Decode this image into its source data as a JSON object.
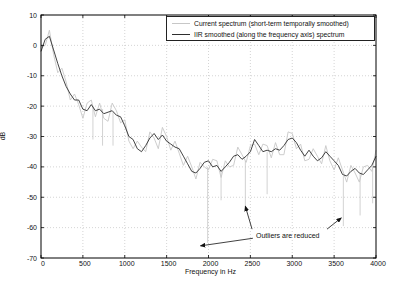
{
  "figure": {
    "background_color": "#ffffff",
    "axis_color": "#000000",
    "grid_color": "#b8b8b8"
  },
  "chart_data": {
    "type": "line",
    "title": "",
    "xlabel": "Frequency in Hz",
    "ylabel": "dB",
    "xlim": [
      0,
      4000
    ],
    "ylim": [
      -70,
      10
    ],
    "xticks": [
      0,
      500,
      1000,
      1500,
      2000,
      2500,
      3000,
      3500,
      4000
    ],
    "yticks": [
      10,
      0,
      -10,
      -20,
      -30,
      -40,
      -50,
      -60,
      -70
    ],
    "grid": "dotted",
    "legend_position": "top-right",
    "x_start": 0,
    "x_step": 50,
    "series": [
      {
        "name": "Current spectrum (short-term temporally smoothed)",
        "color": "#c7c7c7",
        "values": [
          -0.5,
          0,
          5,
          -3,
          -9,
          -7.5,
          -12,
          -18,
          -16,
          -19.5,
          -24,
          -19,
          -18,
          -23.5,
          -19,
          -24,
          -25,
          -19,
          -21.5,
          -25.5,
          -24.5,
          -31.5,
          -34,
          -31.5,
          -33.5,
          -35,
          -28.5,
          -30.5,
          -34,
          -27,
          -30,
          -34.5,
          -31.5,
          -35.5,
          -39.5,
          -36.5,
          -40,
          -44,
          -38.5,
          -40,
          -41,
          -37.5,
          -38,
          -43.5,
          -38,
          -40,
          -39.5,
          -33.5,
          -36,
          -38.5,
          -33,
          -32.5,
          -36,
          -32.5,
          -33,
          -37,
          -32,
          -36,
          -36,
          -28.5,
          -29,
          -34,
          -32.5,
          -38,
          -37.5,
          -34,
          -36.5,
          -39,
          -33,
          -38,
          -41,
          -37,
          -41,
          -45,
          -39.5,
          -42,
          -45,
          -40,
          -39.5,
          -41.5,
          -34.5
        ]
      },
      {
        "name": "IIR smoothed (along the frequency axis) spectrum",
        "color": "#2e2e2e",
        "values": [
          -2,
          2,
          3,
          -1.5,
          -6,
          -10,
          -13.5,
          -16,
          -18,
          -18,
          -21,
          -21.5,
          -19.5,
          -21.5,
          -21,
          -22.5,
          -22,
          -21.5,
          -23,
          -23.5,
          -26.5,
          -30,
          -31,
          -34,
          -35,
          -33,
          -30.5,
          -29,
          -31,
          -29.5,
          -31.5,
          -32.5,
          -33.5,
          -34,
          -36.5,
          -39,
          -41.5,
          -42,
          -40.5,
          -38.5,
          -38,
          -40,
          -39.5,
          -41.5,
          -40,
          -38.5,
          -36.5,
          -36,
          -37.5,
          -36.5,
          -35,
          -31,
          -33,
          -35,
          -34.5,
          -35,
          -34,
          -34.5,
          -33,
          -31,
          -30.5,
          -32,
          -34.5,
          -36.5,
          -34.5,
          -36.5,
          -38,
          -37,
          -35,
          -36.5,
          -38,
          -39.5,
          -42.5,
          -43,
          -41.5,
          -40.5,
          -42,
          -42.5,
          -41,
          -39.5,
          -36.5
        ]
      }
    ],
    "outlier_spikes": [
      {
        "f": 620,
        "from": -20,
        "to": -31
      },
      {
        "f": 735,
        "from": -21,
        "to": -33
      },
      {
        "f": 860,
        "from": -22,
        "to": -33
      },
      {
        "f": 1990,
        "from": -40,
        "to": -65
      },
      {
        "f": 2150,
        "from": -41,
        "to": -51
      },
      {
        "f": 2440,
        "from": -38,
        "to": -54.5
      },
      {
        "f": 2700,
        "from": -35,
        "to": -49
      },
      {
        "f": 3610,
        "from": -43,
        "to": -59.5
      },
      {
        "f": 3810,
        "from": -42,
        "to": -56
      },
      {
        "f": 3960,
        "from": -40,
        "to": -52
      }
    ],
    "annotation": {
      "text": "Outliers are reduced",
      "arrows": [
        {
          "from": [
            2530,
            -63.5
          ],
          "to": [
            1905,
            -66
          ]
        },
        {
          "from": [
            2520,
            -60.5
          ],
          "to": [
            2440,
            -53
          ]
        },
        {
          "from": [
            3415,
            -60.5
          ],
          "to": [
            3585,
            -56.8
          ]
        }
      ]
    }
  }
}
